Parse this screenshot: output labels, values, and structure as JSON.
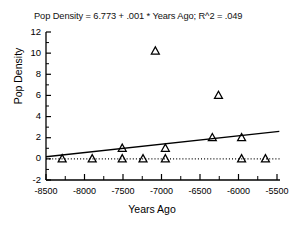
{
  "chart_data": {
    "type": "scatter",
    "title": "Pop Density = 6.773 + .001 * Years Ago; R^2 = .049",
    "xlabel": "Years Ago",
    "ylabel": "Pop Density",
    "xlim": [
      -8500,
      -5500
    ],
    "ylim": [
      -2,
      12
    ],
    "xticks": [
      -8500,
      -8000,
      -7500,
      -7000,
      -6500,
      -6000,
      -5500
    ],
    "xtick_labels": [
      "-8500",
      "-8000",
      "-7500",
      "-7000",
      "-6500",
      "-6000",
      "-5500"
    ],
    "yticks": [
      -2,
      0,
      2,
      4,
      6,
      8,
      10,
      12
    ],
    "ytick_labels": [
      "-2",
      "0",
      "2",
      "4",
      "6",
      "8",
      "10",
      "12"
    ],
    "x_minor_ticks": [
      -8250,
      -7750,
      -7250,
      -6750,
      -6250,
      -5750
    ],
    "y_minor_ticks": [
      -1,
      1,
      3,
      5,
      7,
      9,
      11
    ],
    "grid": false,
    "legend": false,
    "marker": "triangle-open",
    "marker_color": "#000000",
    "points": [
      {
        "x": -8290,
        "y": 0.0
      },
      {
        "x": -7900,
        "y": 0.0
      },
      {
        "x": -7510,
        "y": 1.0
      },
      {
        "x": -7510,
        "y": 0.0
      },
      {
        "x": -7240,
        "y": 0.0
      },
      {
        "x": -7080,
        "y": 10.2
      },
      {
        "x": -6950,
        "y": 1.0
      },
      {
        "x": -6950,
        "y": 0.0
      },
      {
        "x": -6340,
        "y": 2.0
      },
      {
        "x": -6260,
        "y": 6.0
      },
      {
        "x": -5960,
        "y": 2.0
      },
      {
        "x": -5960,
        "y": 0.0
      },
      {
        "x": -5650,
        "y": 0.0
      }
    ],
    "regression_line": {
      "x_start": -8500,
      "y_start": 0.2,
      "x_end": -5470,
      "y_end": 2.6,
      "intercept": 6.773,
      "slope": 0.001,
      "r_squared": 0.049
    },
    "zero_line": {
      "y": 0,
      "style": "dotted",
      "x_start": -8500,
      "x_end": -5450
    }
  }
}
